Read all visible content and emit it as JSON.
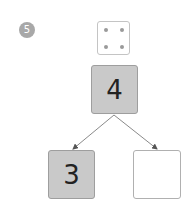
{
  "problem": {
    "number": "5"
  },
  "die": {
    "face_value": 4,
    "pips": [
      {
        "x": 6,
        "y": 6
      },
      {
        "x": 23,
        "y": 6
      },
      {
        "x": 6,
        "y": 23
      },
      {
        "x": 23,
        "y": 23
      }
    ]
  },
  "number_bond": {
    "whole": "4",
    "part_left": "3",
    "part_right": ""
  },
  "colors": {
    "badge": "#a8a8a8",
    "filled_box": "#c9c9c9",
    "arrow": "#8a8a8a"
  }
}
